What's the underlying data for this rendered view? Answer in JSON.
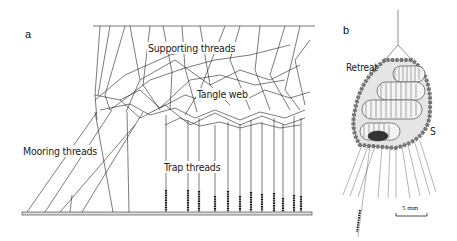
{
  "panels": {
    "a": {
      "label": "a",
      "annotations": {
        "supporting": "Supporting threads",
        "tangle": "Tangle web",
        "mooring": "Mooring threads",
        "trap": "Trap threads"
      }
    },
    "b": {
      "label": "b",
      "annotations": {
        "retreat": "Retreat",
        "s": "S"
      },
      "scale_bar": "5 mm"
    }
  }
}
